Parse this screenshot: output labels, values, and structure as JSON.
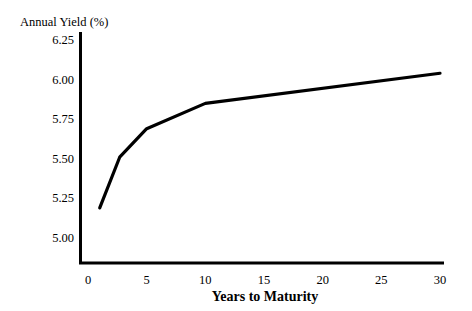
{
  "chart_data": {
    "type": "line",
    "title": "",
    "ylabel": "Annual Yield (%)",
    "xlabel": "Years to Maturity",
    "x": [
      1,
      2.7,
      5,
      10,
      30
    ],
    "values": [
      5.19,
      5.51,
      5.69,
      5.85,
      6.04
    ],
    "series": [
      {
        "name": "Yield Curve",
        "x": [
          1,
          2.7,
          5,
          10,
          30
        ],
        "values": [
          5.19,
          5.51,
          5.69,
          5.85,
          6.04
        ]
      }
    ],
    "xlim": [
      0,
      30
    ],
    "ylim": [
      5.0,
      6.25
    ],
    "x_ticks": [
      0,
      5,
      10,
      15,
      20,
      25,
      30
    ],
    "y_ticks": [
      5.0,
      5.25,
      5.5,
      5.75,
      6.0,
      6.25
    ],
    "x_tick_labels": [
      "0",
      "5",
      "10",
      "15",
      "20",
      "25",
      "30"
    ],
    "y_tick_labels": [
      "5.00",
      "5.25",
      "5.50",
      "5.75",
      "6.00",
      "6.25"
    ],
    "grid": false,
    "legend": false,
    "line_color": "#000000",
    "background_color": "#ffffff"
  },
  "axes": {
    "y_axis_title": "Annual Yield (%)",
    "x_axis_title": "Years to Maturity"
  },
  "y_tick_labels": {
    "t0": "5.00",
    "t1": "5.25",
    "t2": "5.50",
    "t3": "5.75",
    "t4": "6.00",
    "t5": "6.25"
  },
  "x_tick_labels": {
    "t0": "0",
    "t1": "5",
    "t2": "10",
    "t3": "15",
    "t4": "20",
    "t5": "25",
    "t6": "30"
  }
}
